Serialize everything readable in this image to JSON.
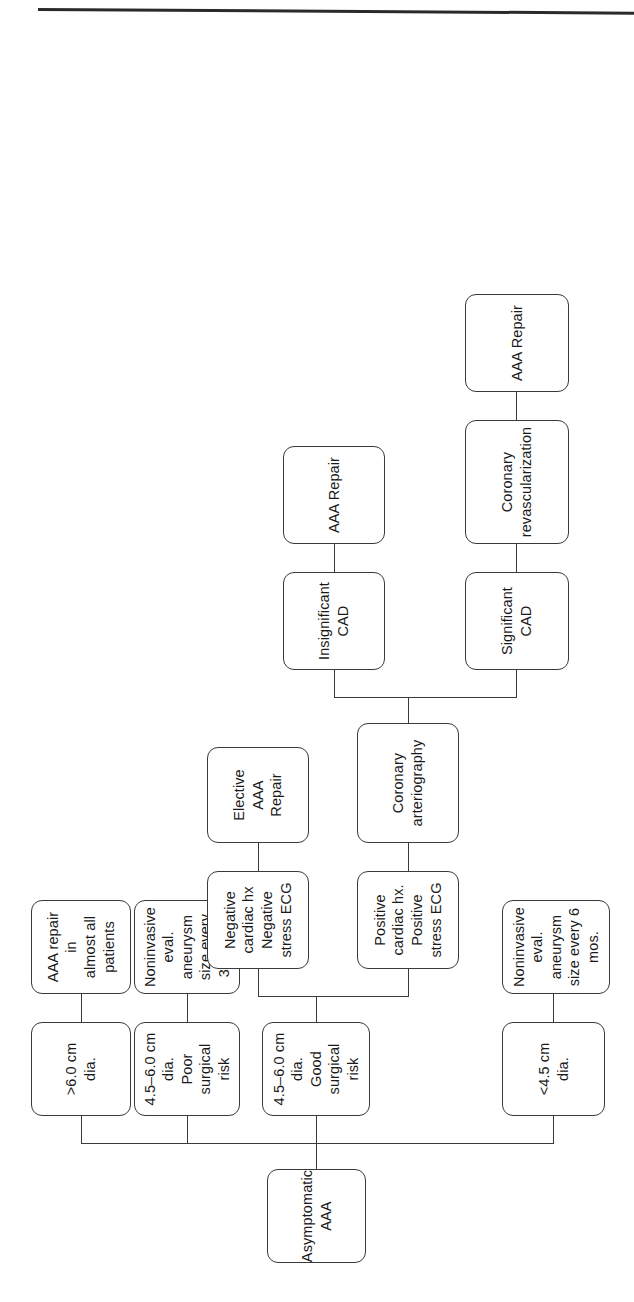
{
  "figure": {
    "orientation": "rotated-90",
    "type": "flowchart",
    "line_color": "#3a3a3a",
    "background_color": "#ffffff"
  },
  "nodes": {
    "root": "Asymptomatic\nAAA",
    "size_gt6": ">6.0 cm dia.",
    "repair_almost_all": "AAA repair in\nalmost all patients",
    "size_45_60_poor": "4.5–6.0 cm dia.\nPoor surgical risk",
    "eval_3_6": "Noninvasive eval. aneurysm\nsize every 3–6 mos.",
    "size_45_60_good": "4.5–6.0 cm dia.\nGood surgical risk",
    "neg_cardiac": "Negative cardiac hx\nNegative stress ECG",
    "elective_repair": "Elective AAA\nRepair",
    "pos_cardiac": "Positive cardiac hx.\nPositive stress ECG",
    "coronary_arteriography": "Coronary\narteriography",
    "insignificant_cad": "Insignificant\nCAD",
    "aaa_repair_insig": "AAA Repair",
    "significant_cad": "Significant\nCAD",
    "coronary_revasc": "Coronary\nrevascularization",
    "aaa_repair_sig": "AAA Repair",
    "size_lt45": "<4.5 cm dia.",
    "eval_6": "Noninvasive eval.\naneurysm size every 6 mos."
  }
}
